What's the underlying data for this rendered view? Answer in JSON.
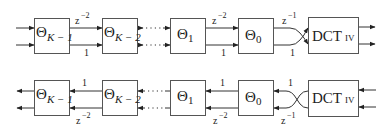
{
  "diagram": {
    "top_row": {
      "blocks": [
        {
          "symbol": "Θ",
          "subscript": "K − 1"
        },
        {
          "symbol": "Θ",
          "subscript": "K − 2"
        },
        {
          "symbol": "Θ",
          "subscript": "1"
        },
        {
          "symbol": "Θ",
          "subscript": "0"
        },
        {
          "label": "DCT",
          "suffix": "IV"
        }
      ],
      "connections": [
        {
          "from": "Θ K−1",
          "to": "Θ K−2",
          "upper": {
            "base": "z",
            "exp": "−2"
          },
          "lower": "1"
        },
        {
          "from": "Θ K−2",
          "to": "Θ 1",
          "style": "dotted"
        },
        {
          "from": "Θ 1",
          "to": "Θ 0",
          "upper": {
            "base": "z",
            "exp": "−2"
          },
          "lower": "1"
        },
        {
          "from": "Θ 0",
          "to": "DCT IV",
          "upper": {
            "base": "z",
            "exp": "−1"
          },
          "lower": "1",
          "crossover": true
        }
      ],
      "direction": "left-to-right"
    },
    "bottom_row": {
      "blocks": [
        {
          "symbol": "Θ",
          "subscript": "K − 1"
        },
        {
          "symbol": "Θ",
          "subscript": "K − 2"
        },
        {
          "symbol": "Θ",
          "subscript": "1"
        },
        {
          "symbol": "Θ",
          "subscript": "0"
        },
        {
          "label": "DCT",
          "suffix": "IV"
        }
      ],
      "connections": [
        {
          "from": "Θ K−2",
          "to": "Θ K−1",
          "upper": "1",
          "lower": {
            "base": "z",
            "exp": "−2"
          }
        },
        {
          "from": "Θ 1",
          "to": "Θ K−2",
          "style": "dotted"
        },
        {
          "from": "Θ 0",
          "to": "Θ 1",
          "upper": "1",
          "lower": {
            "base": "z",
            "exp": "−2"
          }
        },
        {
          "from": "DCT IV",
          "to": "Θ 0",
          "upper": "1",
          "lower": {
            "base": "z",
            "exp": "−1"
          },
          "crossover": true
        }
      ],
      "direction": "right-to-left"
    }
  }
}
